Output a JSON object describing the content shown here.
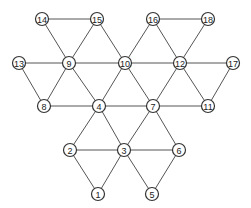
{
  "diagram": {
    "type": "graph",
    "node_radius": 6.5,
    "nodes": [
      {
        "id": "1",
        "label": "1",
        "x": 98,
        "y": 194
      },
      {
        "id": "2",
        "label": "2",
        "x": 70,
        "y": 150
      },
      {
        "id": "3",
        "label": "3",
        "x": 124,
        "y": 150
      },
      {
        "id": "4",
        "label": "4",
        "x": 99,
        "y": 106
      },
      {
        "id": "5",
        "label": "5",
        "x": 152,
        "y": 194
      },
      {
        "id": "6",
        "label": "6",
        "x": 179,
        "y": 150
      },
      {
        "id": "7",
        "label": "7",
        "x": 153,
        "y": 106
      },
      {
        "id": "8",
        "label": "8",
        "x": 44,
        "y": 106
      },
      {
        "id": "9",
        "label": "9",
        "x": 69,
        "y": 63
      },
      {
        "id": "10",
        "label": "10",
        "x": 125,
        "y": 63
      },
      {
        "id": "11",
        "label": "11",
        "x": 208,
        "y": 106
      },
      {
        "id": "12",
        "label": "12",
        "x": 180,
        "y": 63
      },
      {
        "id": "13",
        "label": "13",
        "x": 19,
        "y": 63
      },
      {
        "id": "14",
        "label": "14",
        "x": 42,
        "y": 19
      },
      {
        "id": "15",
        "label": "15",
        "x": 97,
        "y": 19
      },
      {
        "id": "16",
        "label": "16",
        "x": 153,
        "y": 19
      },
      {
        "id": "17",
        "label": "17",
        "x": 233,
        "y": 63
      },
      {
        "id": "18",
        "label": "18",
        "x": 208,
        "y": 19
      }
    ],
    "edges": [
      [
        "14",
        "15"
      ],
      [
        "14",
        "9"
      ],
      [
        "15",
        "9"
      ],
      [
        "15",
        "10"
      ],
      [
        "16",
        "18"
      ],
      [
        "16",
        "10"
      ],
      [
        "16",
        "12"
      ],
      [
        "18",
        "12"
      ],
      [
        "13",
        "9"
      ],
      [
        "9",
        "10"
      ],
      [
        "10",
        "12"
      ],
      [
        "12",
        "17"
      ],
      [
        "13",
        "8"
      ],
      [
        "9",
        "8"
      ],
      [
        "9",
        "4"
      ],
      [
        "10",
        "4"
      ],
      [
        "10",
        "7"
      ],
      [
        "12",
        "7"
      ],
      [
        "12",
        "11"
      ],
      [
        "17",
        "11"
      ],
      [
        "8",
        "4"
      ],
      [
        "4",
        "7"
      ],
      [
        "7",
        "11"
      ],
      [
        "4",
        "2"
      ],
      [
        "4",
        "3"
      ],
      [
        "7",
        "3"
      ],
      [
        "7",
        "6"
      ],
      [
        "2",
        "3"
      ],
      [
        "3",
        "6"
      ],
      [
        "2",
        "1"
      ],
      [
        "3",
        "1"
      ],
      [
        "3",
        "5"
      ],
      [
        "6",
        "5"
      ]
    ]
  }
}
